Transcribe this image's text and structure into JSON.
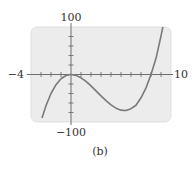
{
  "figure": {
    "caption": "(b)",
    "labels": {
      "y_max": "100",
      "y_min": "−100",
      "x_min": "−4",
      "x_max": "10"
    },
    "colors": {
      "plot_background": "#ececec",
      "curve": "#7a7a7a",
      "axes": "#6f6f6f",
      "text": "#333333"
    }
  },
  "chart_data": {
    "type": "line",
    "title": "",
    "caption": "(b)",
    "xlabel": "",
    "ylabel": "",
    "xlim": [
      -4,
      10
    ],
    "ylim": [
      -100,
      100
    ],
    "x_tick_step": 1,
    "y_tick_step": 20,
    "grid": false,
    "legend": null,
    "function_hint": "y = x^3 - 8x^2",
    "series": [
      {
        "name": "curve",
        "x": [
          -2.9,
          -2.5,
          -2,
          -1.5,
          -1,
          -0.5,
          0,
          0.5,
          1,
          1.5,
          2,
          2.5,
          3,
          3.5,
          4,
          4.5,
          5,
          5.333,
          5.5,
          6,
          6.5,
          7,
          7.5,
          8,
          8.5,
          9,
          9.2
        ],
        "values": [
          -91.7,
          -65.6,
          -40,
          -21.4,
          -9,
          -2.1,
          0,
          -1.9,
          -7,
          -14.6,
          -24,
          -34.4,
          -45,
          -55.1,
          -64,
          -70.9,
          -75,
          -75.9,
          -75.6,
          -72,
          -64.7,
          -49,
          -28.1,
          0,
          34,
          81,
          101.6
        ]
      }
    ],
    "annotations": [
      {
        "text": "100",
        "position": "top of y-axis"
      },
      {
        "text": "−100",
        "position": "bottom of y-axis"
      },
      {
        "text": "−4",
        "position": "left end of x-axis"
      },
      {
        "text": "10",
        "position": "right end of x-axis"
      }
    ]
  }
}
